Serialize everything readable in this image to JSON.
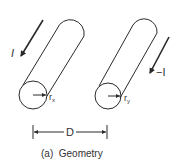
{
  "diagram": {
    "type": "two-conductor geometry",
    "conductor_x": {
      "current_label": "I",
      "radius_label": "r",
      "radius_subscript": "x"
    },
    "conductor_y": {
      "current_label": "−I",
      "radius_label": "r",
      "radius_subscript": "y"
    },
    "spacing_label": "D",
    "caption": "(a)  Geometry"
  },
  "colors": {
    "stroke": "#2a2a2a",
    "text": "#333333",
    "background": "#ffffff"
  }
}
